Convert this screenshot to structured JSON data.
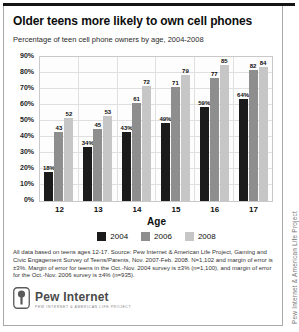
{
  "page": {
    "title": "Older teens more likely to own cell phones",
    "subtitle": "Percentage of teen cell phone owners by age, 2004-2008"
  },
  "chart_data": {
    "type": "bar",
    "title": "Older teens more likely to own cell phones",
    "subtitle": "Percentage of teen cell phone owners by age, 2004-2008",
    "categories": [
      "12",
      "13",
      "14",
      "15",
      "16",
      "17"
    ],
    "xlabel": "Age",
    "ylabel": "",
    "ylim": [
      0,
      90
    ],
    "ytick_step": 10,
    "ytick_suffix": "%",
    "grid": true,
    "legend_position": "bottom",
    "series": [
      {
        "name": "2004",
        "color": "#1b1b1b",
        "values": [
          18,
          34,
          43,
          49,
          59,
          64
        ],
        "labels": [
          "18%",
          "34%",
          "43%",
          "49%",
          "59%",
          "64%"
        ]
      },
      {
        "name": "2006",
        "color": "#8e8e8e",
        "values": [
          43,
          45,
          61,
          71,
          77,
          82
        ],
        "labels": [
          "43",
          "45",
          "61",
          "71",
          "77",
          "82"
        ]
      },
      {
        "name": "2008",
        "color": "#c6c6c6",
        "values": [
          52,
          53,
          72,
          79,
          85,
          84
        ],
        "labels": [
          "52",
          "53",
          "72",
          "79",
          "85",
          "84"
        ]
      }
    ]
  },
  "footnote": "All data based on teens ages 12-17. Source: Pew Internet & American Life Project, Gaming and Civic Engagement Survey of Teens/Parents, Nov. 2007-Feb. 2008. N=1,102 and margin of error is ±3%. Margin of error for teens in the Oct.-Nov. 2004 survey is ±3% (n=1,100), and margin of error for the Oct.-Nov. 2006 survey is ±4% (n=935).",
  "logo": {
    "name": "Pew Internet",
    "tagline": "Pew Internet & American Life Project"
  },
  "side_text": "Pew Internet & American Life Project",
  "colors": {
    "series_2004": "#1b1b1b",
    "series_2006": "#8e8e8e",
    "series_2008": "#c6c6c6",
    "grid": "#e0e0e0",
    "top_rule": "#141414"
  }
}
